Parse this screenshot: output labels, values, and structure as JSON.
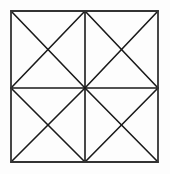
{
  "figure": {
    "background_color": "#fdfdfd",
    "stroke_color": "#1a1a1a",
    "border_stroke_color": "#333333",
    "stroke_width": 1.6,
    "border_stroke_width": 1.8,
    "canvas": {
      "width": 170,
      "height": 174
    },
    "geometry": {
      "left": 11,
      "top": 11,
      "right": 158,
      "bottom": 162,
      "center_x": 85,
      "center_y": 88,
      "width": 147,
      "height": 151,
      "rows": 2,
      "columns": 2,
      "quadrant_count": 4,
      "diagonals_per_quadrant": 2,
      "total_diagonal_segments": 8,
      "lines_meeting_at_center": 8
    },
    "outline": {
      "name": "outer-square",
      "points": "11,11 158,11 158,162 11,162"
    },
    "midlines": [
      {
        "name": "horizontal-midline",
        "x1": 11,
        "y1": 88,
        "x2": 158,
        "y2": 88
      },
      {
        "name": "vertical-midline",
        "x1": 85,
        "y1": 11,
        "x2": 85,
        "y2": 162
      }
    ],
    "diagonals": [
      {
        "name": "top-left-diagonal-a",
        "x1": 11,
        "y1": 11,
        "x2": 85,
        "y2": 88
      },
      {
        "name": "top-left-diagonal-b",
        "x1": 85,
        "y1": 11,
        "x2": 11,
        "y2": 88
      },
      {
        "name": "top-right-diagonal-a",
        "x1": 85,
        "y1": 11,
        "x2": 158,
        "y2": 88
      },
      {
        "name": "top-right-diagonal-b",
        "x1": 158,
        "y1": 11,
        "x2": 85,
        "y2": 88
      },
      {
        "name": "bottom-left-diagonal-a",
        "x1": 11,
        "y1": 88,
        "x2": 85,
        "y2": 162
      },
      {
        "name": "bottom-left-diagonal-b",
        "x1": 85,
        "y1": 88,
        "x2": 11,
        "y2": 162
      },
      {
        "name": "bottom-right-diagonal-a",
        "x1": 85,
        "y1": 88,
        "x2": 158,
        "y2": 162
      },
      {
        "name": "bottom-right-diagonal-b",
        "x1": 158,
        "y1": 88,
        "x2": 85,
        "y2": 162
      }
    ]
  }
}
